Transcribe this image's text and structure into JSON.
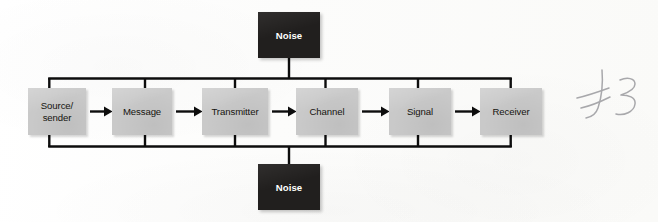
{
  "figure": {
    "background_color": "#fdfdfc",
    "box_fill_gray": "#c9c9c9",
    "box_fill_dark": "#211f1e",
    "line_color": "#000000",
    "text_color_dark_box": "#ffffff",
    "text_color_gray_box": "#15140f"
  },
  "chain": {
    "boxes": [
      {
        "id": "source",
        "label": "Source/\nsender",
        "line1": "Source/",
        "line2": "sender",
        "x": 28,
        "y": 88,
        "w": 58,
        "h": 47
      },
      {
        "id": "message",
        "label": "Message",
        "x": 112,
        "y": 88,
        "w": 60,
        "h": 47
      },
      {
        "id": "transmitter",
        "label": "Transmitter",
        "x": 202,
        "y": 88,
        "w": 66,
        "h": 47
      },
      {
        "id": "channel",
        "label": "Channel",
        "x": 296,
        "y": 88,
        "w": 62,
        "h": 47
      },
      {
        "id": "signal",
        "label": "Signal",
        "x": 389,
        "y": 88,
        "w": 62,
        "h": 47
      },
      {
        "id": "receiver",
        "label": "Receiver",
        "x": 480,
        "y": 88,
        "w": 62,
        "h": 47
      }
    ]
  },
  "noise": {
    "top": {
      "id": "noise-top",
      "label": "Noise",
      "x": 258,
      "y": 12,
      "w": 62,
      "h": 46
    },
    "bottom": {
      "id": "noise-bottom",
      "label": "Noise",
      "x": 258,
      "y": 164,
      "w": 62,
      "h": 46
    }
  },
  "bus": {
    "top_y": 78,
    "bottom_y": 146,
    "left_x": 49,
    "right_x": 511,
    "drop_x_positions": [
      49,
      145,
      235,
      325,
      418,
      511
    ],
    "noise_connector_x": 289
  },
  "annotation": {
    "handwritten_mark": "#3",
    "description": "faint handwritten pencil mark at right margin"
  }
}
